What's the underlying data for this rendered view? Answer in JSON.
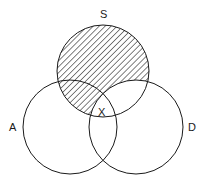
{
  "diagram": {
    "type": "venn",
    "sets": [
      {
        "id": "S",
        "label": "S",
        "cx": 103,
        "cy": 71,
        "r": 46
      },
      {
        "id": "A",
        "label": "A",
        "cx": 70,
        "cy": 127,
        "r": 47
      },
      {
        "id": "D",
        "label": "D",
        "cx": 136,
        "cy": 127,
        "r": 47
      }
    ],
    "shaded_region": "S minus D",
    "center_label": "X",
    "colors": {
      "stroke": "#1a1a1a",
      "hatch": "#1a1a1a",
      "background": "#ffffff"
    }
  }
}
